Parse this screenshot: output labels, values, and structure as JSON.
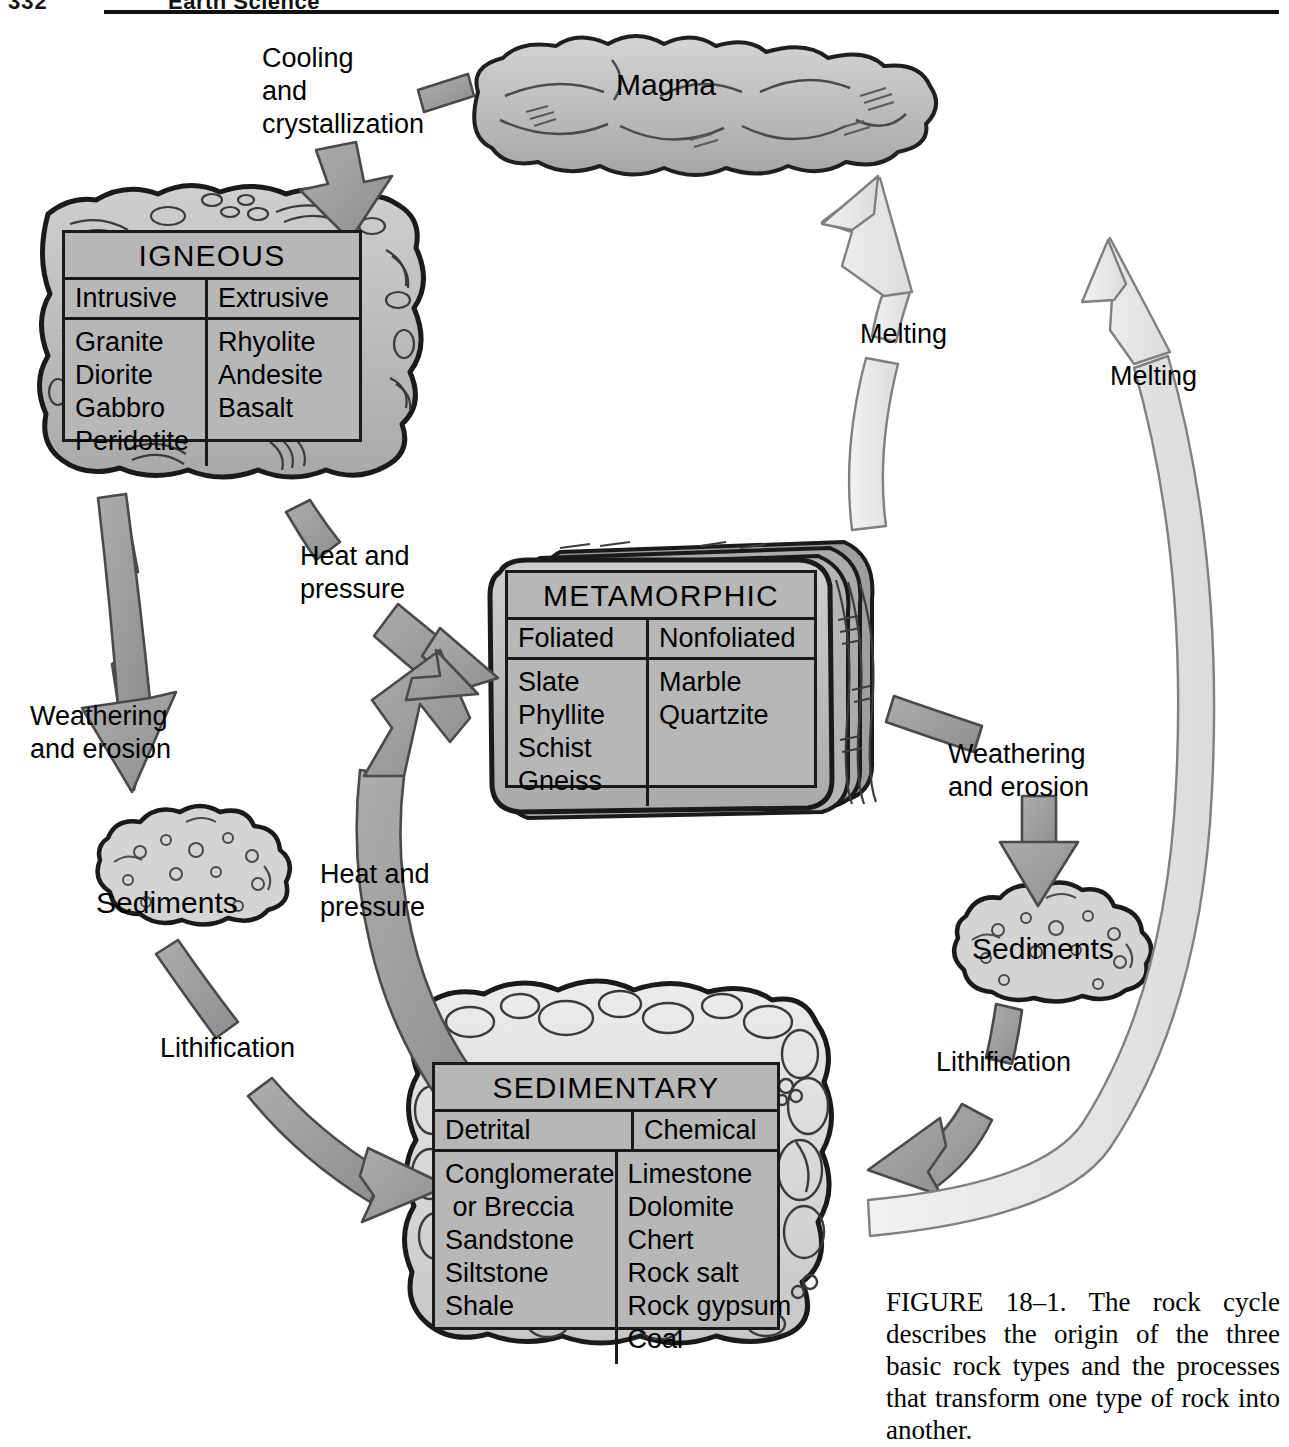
{
  "page": {
    "page_number": "332",
    "running_title": "Earth Science"
  },
  "figure": {
    "caption": "FIGURE 18–1. The rock cycle describes the origin of the three basic rock types and the processes that transform one type of rock into another."
  },
  "nodes": {
    "magma": {
      "label": "Magma"
    },
    "sediments_left": {
      "label": "Sediments"
    },
    "sediments_right": {
      "label": "Sediments"
    }
  },
  "processes": {
    "cooling": {
      "label": "Cooling\nand\ncrystallization"
    },
    "weathering_left": {
      "label": "Weathering\nand erosion"
    },
    "weathering_right": {
      "label": "Weathering\nand erosion"
    },
    "heat_pressure_top": {
      "label": "Heat and\npressure"
    },
    "heat_pressure_bottom": {
      "label": "Heat and\npressure"
    },
    "lithification_left": {
      "label": "Lithification"
    },
    "lithification_right": {
      "label": "Lithification"
    },
    "melting_inner": {
      "label": "Melting"
    },
    "melting_outer": {
      "label": "Melting"
    }
  },
  "rock_tables": {
    "igneous": {
      "title": "IGNEOUS",
      "columns": [
        "Intrusive",
        "Extrusive"
      ],
      "cells": [
        [
          "Granite",
          "Diorite",
          "Gabbro",
          "Peridotite"
        ],
        [
          "Rhyolite",
          "Andesite",
          "Basalt"
        ]
      ]
    },
    "metamorphic": {
      "title": "METAMORPHIC",
      "columns": [
        "Foliated",
        "Nonfoliated"
      ],
      "cells": [
        [
          "Slate",
          "Phyllite",
          "Schist",
          "Gneiss"
        ],
        [
          "Marble",
          "Quartzite"
        ]
      ]
    },
    "sedimentary": {
      "title": "SEDIMENTARY",
      "columns": [
        "Detrital",
        "Chemical"
      ],
      "cells": [
        [
          "Conglomerate",
          " or Breccia",
          "Sandstone",
          "Siltstone",
          "Shale"
        ],
        [
          "Limestone",
          "Dolomite",
          "Chert",
          "Rock salt",
          "Rock gypsum",
          "Coal"
        ]
      ]
    }
  },
  "colors": {
    "arrow_gray": "#9c9c9c",
    "arrow_gray_stroke": "#4a4a4a",
    "arrow_light": "#e9e9e9",
    "arrow_light_stroke": "#ararar",
    "rock_fill": "#b7b7b7",
    "rock_outline": "#1a1a1a",
    "page_bg": "#ffffff"
  }
}
